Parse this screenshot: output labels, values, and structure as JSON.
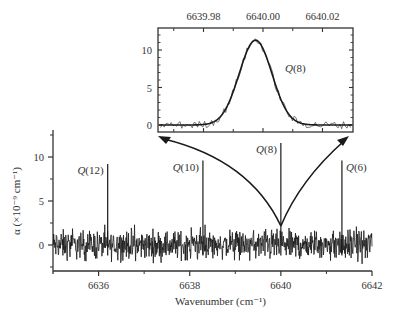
{
  "chart_data": [
    {
      "name": "main",
      "type": "line",
      "title": "",
      "xlabel": "Wavenumber (cm⁻¹)",
      "ylabel": "α (×10⁻⁹ cm⁻¹)",
      "xlim": [
        6635,
        6642
      ],
      "ylim": [
        -3.3,
        13
      ],
      "xticks": [
        6636,
        6638,
        6640,
        6642
      ],
      "xtick_labels": [
        "6636",
        "6638",
        "6640",
        "6642"
      ],
      "xminor": [
        6635,
        6637,
        6639,
        6641
      ],
      "yticks": [
        0,
        5,
        10
      ],
      "ytick_labels": [
        "0",
        "5",
        "10"
      ],
      "yminor": [
        -2.5,
        2.5,
        7.5,
        12.5
      ],
      "grid": false,
      "noise_band": [
        -2.2,
        2.3
      ],
      "peaks": [
        {
          "label": "Q(12)",
          "label_main": "Q",
          "label_num": "(12)",
          "x": 6636.2,
          "y": 9.2
        },
        {
          "label": "Q(10)",
          "label_main": "Q",
          "label_num": "(10)",
          "x": 6638.29,
          "y": 9.6
        },
        {
          "label": "Q(8)",
          "label_main": "Q",
          "label_num": "(8)",
          "x": 6640.0,
          "y": 11.6
        },
        {
          "label": "Q(6)",
          "label_main": "Q",
          "label_num": "(6)",
          "x": 6641.34,
          "y": 9.6
        }
      ],
      "annotation": "Arrows from Q(8) peak base point to inset lower corners (zoom)"
    },
    {
      "name": "inset",
      "type": "line",
      "title": "",
      "xlabel": "",
      "ylabel": "",
      "xlim": [
        6639.965,
        6640.03
      ],
      "ylim": [
        -1,
        12.3
      ],
      "xticks": [
        6639.98,
        6640.0,
        6640.02
      ],
      "xtick_labels": [
        "6639.98",
        "6640.00",
        "6640.02"
      ],
      "xaxis_position": "top",
      "yticks": [
        0,
        5,
        10
      ],
      "ytick_labels": [
        "0",
        "5",
        "10"
      ],
      "grid": false,
      "series": [
        {
          "name": "measured",
          "style": "noisy-thin"
        },
        {
          "name": "Gaussian fit",
          "style": "smooth-thick",
          "center": 6639.9975,
          "amplitude": 11.3,
          "sigma": 0.0055
        }
      ],
      "annotation": {
        "label": "Q(8)",
        "label_main": "Q",
        "label_num": "(8)",
        "x": 6640.009,
        "y": 8.6
      }
    }
  ],
  "colors": {
    "line": "#1a1a1a",
    "axis": "#333333",
    "text": "#333333",
    "background": "#ffffff"
  }
}
